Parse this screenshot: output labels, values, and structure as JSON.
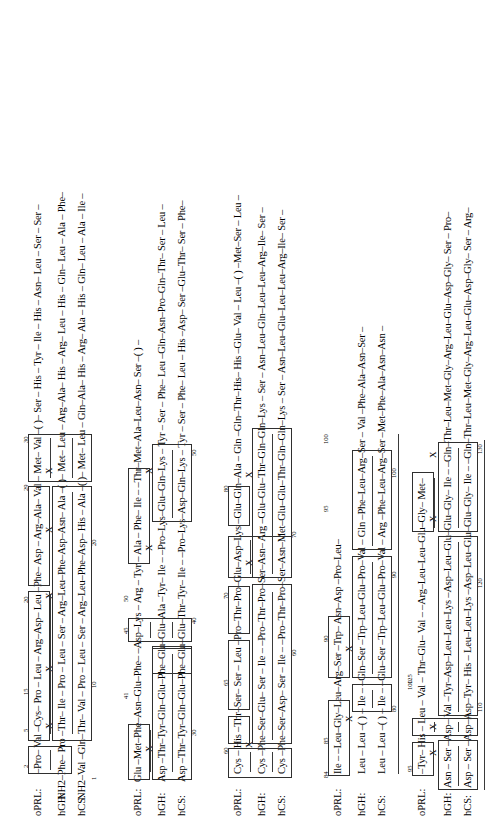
{
  "figure": {
    "type": "sequence-alignment",
    "row_labels": [
      "oPRL:",
      "hGH:",
      "hCS:"
    ],
    "rotation_deg": -90,
    "identity_mark": "X",
    "gap_mark": "( )",
    "blocks": [
      {
        "id": "block-1",
        "numbers": [
          "2",
          "5",
          "15",
          "20",
          "29",
          "30",
          "1",
          "10",
          "20"
        ],
        "rows": [
          {
            "label": "oPRL:",
            "seq": "–Pro– Val –Cys– Pro – Leu – Arg–Asp– Leu –Phe– Asp – Arg–Ala– Val – Met– Val –( )– Ser – His – Tyr – Ile – His – Asn– Leu – Ser – Ser –"
          },
          {
            "label": "hGH:",
            "seq": "NH2–Phe– Pro –Thr– Ile – Pro – Leu – Ser – Arg–Leu–Phe–Asp–Asn– Ala –( )– Met– Leu – Arg–Ala– His – Arg– Leu – His – Gln– Leu – Ala – Phe–"
          },
          {
            "label": "hCS:",
            "seq": "NH2–Val –Gln–Thr– Val – Pro – Leu – Ser – Arg–Leu–Phe–Asp– His – Ala –( )– Met– Leu – Gln–Ala– His – Arg– Ala – His – Gln– Leu – Ala – Ile –"
          }
        ]
      },
      {
        "id": "block-2",
        "numbers": [
          "41",
          "45",
          "50",
          "30",
          "40",
          "50"
        ],
        "rows": [
          {
            "label": "oPRL:",
            "seq": "Glu –Met–Phe–Asn–Glu–Phe– –Asp–Lys – Arg – Tyr – Ala – Phe– Ile – –Thr–Met–Ala–Leu–Asn– Ser –( ) –"
          },
          {
            "label": "hGH:",
            "seq": "Asp –Thr–Tyr–Gln–Glu–Phe–Glu–Glu–Ala –Tyr– Ile – –Pro–Lys–Glu–Gln–Lys – Tyr – Ser – Phe– Leu –Gln–Asn–Pro–Gln–Thr– Ser – Leu –"
          },
          {
            "label": "hCS:",
            "seq": "Asp –Thr–Tyr–Gln–Glu–Phe–Glu–Glu–Thr–Tyr– Ile – –Pro–Lys–Asp–Gln–Lys – Tyr – Ser – Phe– Leu – His –Asp– Ser –Glu–Thr– Ser – Phe–"
          }
        ]
      },
      {
        "id": "block-3",
        "numbers": [
          "60",
          "65",
          "70",
          "80",
          "60",
          "70"
        ],
        "rows": [
          {
            "label": "oPRL:",
            "seq": "Cys – His –Thr–Ser– Ser – Leu –Pro–Thr–Pro–Glu–Asp–Lys –Glu–Gln–Ala – Gln –Gln–Thr–His– His –Glu– Val – Leu –( ) –Met–Ser – Leu –"
          },
          {
            "label": "hGH:",
            "seq": "Cys –Phe–Ser–Glu– Ser – Ile – –Pro–Thr–Pro–Ser–Asn– Arg –Glu–Glu–Thr–Gln–Gln–Lys – Ser – Asn–Leu–Gln–Leu–Leu–Arg–Ile– Ser –"
          },
          {
            "label": "hCS:",
            "seq": "Cys –Phe–Ser–Asp– Ser – Ile – –Pro–Thr–Pro–Ser–Asn–Met–Glu–Glu–Thr–Gln–Gln–Lys – Ser – Asn–Leu–Glu–Leu–Leu–Arg–Ile– Ser –"
          }
        ]
      },
      {
        "id": "block-4",
        "numbers": [
          "84",
          "85",
          "90",
          "95",
          "100",
          "80",
          "90",
          "100"
        ],
        "rows": [
          {
            "label": "oPRL:",
            "seq": "Ile – –Leu–Gly–Leu–Arg–Ser –Trp– Asn–Asp –Pro–Leu–"
          },
          {
            "label": "hGH:",
            "seq": "Leu – Leu –( ) – Ile – –Gln–Ser –Trp–Leu–Glu–Pro–Val – Gln –Phe–Leu–Arg–Ser – Val –Phe–Ala–Asn–Ser –"
          },
          {
            "label": "hCS:",
            "seq": "Leu – Leu –( ) – Ile – –Glu–Ser –Trp–Leu–Glu–Pro–Val – Arg –Phe–Leu–Arg–Ser –Met–Phe–Ala–Asn–Asn –"
          }
        ]
      },
      {
        "id": "block-5",
        "numbers": [
          "95",
          "100",
          "110",
          "120",
          "125",
          "130",
          "100",
          "125",
          "130"
        ],
        "rows": [
          {
            "label": "oPRL:",
            "seq": "–Tyr– His – Leu – Val – Thr–Glu– Val – –Arg–Leu–Leu–Glu–Gly– Met–"
          },
          {
            "label": "hGH:",
            "seq": "Asn – Ser –Asp– Val –Tyr–Asp–Leu–Leu–Lys –Asp–Leu–Glu–Glu–Gly– Ile – –Gln–Thr–Leu–Met–Gly–Arg–Leu–Glu–Asp–Gly– Ser – Pro–"
          },
          {
            "label": "hCS:",
            "seq": "Asp – Ser –Asp–Asp–Tyr– His – Leu–Leu–Lys –Asp–Leu–Glu–Glu–Gly– Ile – –Gln–Thr–Leu–Met–Gly–Arg–Leu–Glu–Asp–Gly– Ser – Arg–"
          }
        ]
      }
    ]
  },
  "colors": {
    "ink": "#000000",
    "rule": "#3a3a3a",
    "paper": "#ffffff"
  }
}
